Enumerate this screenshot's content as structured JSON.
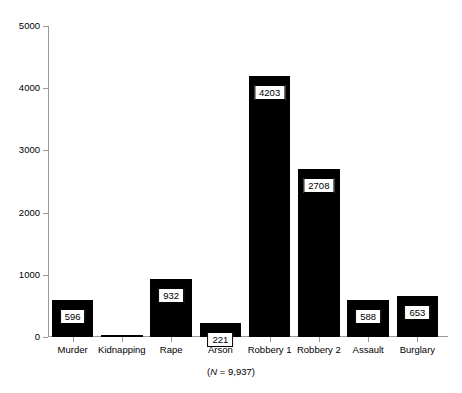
{
  "chart_data": {
    "type": "bar",
    "title": "",
    "subtitle": "",
    "xlabel": "",
    "ylabel": "",
    "categories": [
      "Murder",
      "Kidnapping",
      "Rape",
      "Arson",
      "Robbery 1",
      "Robbery 2",
      "Assault",
      "Burglary"
    ],
    "values": [
      596,
      36,
      932,
      221,
      4203,
      2708,
      588,
      653
    ],
    "value_labels": [
      "596",
      "",
      "932",
      "221",
      "4203",
      "2708",
      "588",
      "653"
    ],
    "ylim": [
      0,
      5000
    ],
    "ytick_values": [
      0,
      1000,
      2000,
      3000,
      4000,
      5000
    ],
    "ytick_labels": [
      "0",
      "1000",
      "2000",
      "3000",
      "4000",
      "5000"
    ],
    "grid": false,
    "legend": null,
    "bar_color": "#000000",
    "axis_color": "#9a9a9a",
    "label_box_fill": "#ffffff",
    "label_box_border": "#000000",
    "annotation": {
      "text_prefix": "(",
      "italic_symbol": "N",
      "text_suffix": " = 9,937)",
      "full_text": "(N = 9,937)"
    }
  }
}
